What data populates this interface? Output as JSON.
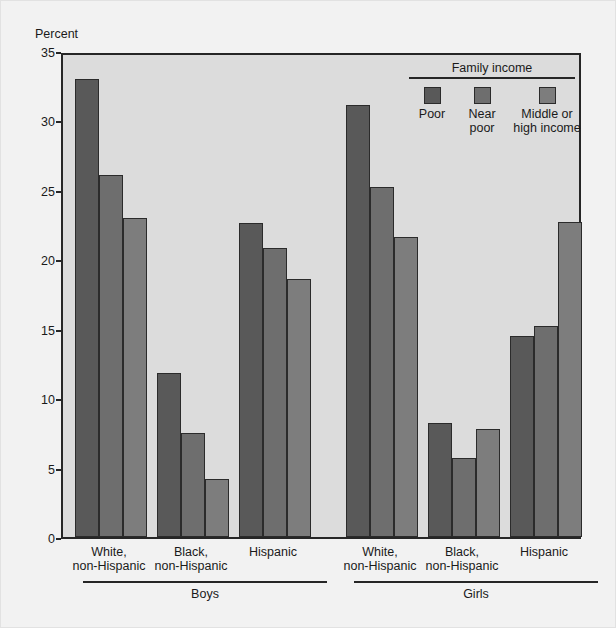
{
  "axis": {
    "ylabel": "Percent",
    "yticks": [
      0,
      5,
      10,
      15,
      20,
      25,
      30,
      35
    ]
  },
  "legend": {
    "title": "Family income",
    "items": [
      {
        "label": "Poor",
        "color": "#595959"
      },
      {
        "label": "Near\npoor",
        "color": "#6e6e6e"
      },
      {
        "label": "Middle or\nhigh income",
        "color": "#7d7d7d"
      }
    ]
  },
  "groups": {
    "boys": "Boys",
    "girls": "Girls"
  },
  "chart_data": {
    "type": "bar",
    "title": "",
    "xlabel": "",
    "ylabel": "Percent",
    "ylim": [
      0,
      35
    ],
    "ytick_step": 5,
    "grid": false,
    "legend_position": "top-right",
    "legend_title": "Family income",
    "categories": [
      "Boys — White, non-Hispanic",
      "Boys — Black, non-Hispanic",
      "Boys — Hispanic",
      "Girls — White, non-Hispanic",
      "Girls — Black, non-Hispanic",
      "Girls — Hispanic"
    ],
    "series": [
      {
        "name": "Poor",
        "color": "#595959",
        "values": [
          33.0,
          11.8,
          22.6,
          31.1,
          8.2,
          14.5
        ]
      },
      {
        "name": "Near poor",
        "color": "#6e6e6e",
        "values": [
          26.1,
          7.5,
          20.8,
          25.2,
          5.7,
          15.2
        ]
      },
      {
        "name": "Middle or high income",
        "color": "#7d7d7d",
        "values": [
          23.0,
          4.2,
          18.6,
          21.6,
          7.8,
          22.7
        ]
      }
    ],
    "group_labels": [
      {
        "sex": "Boys",
        "race": "White,\nnon-Hispanic"
      },
      {
        "sex": "Boys",
        "race": "Black,\nnon-Hispanic"
      },
      {
        "sex": "Boys",
        "race": "Hispanic"
      },
      {
        "sex": "Girls",
        "race": "White,\nnon-Hispanic"
      },
      {
        "sex": "Girls",
        "race": "Black,\nnon-Hispanic"
      },
      {
        "sex": "Girls",
        "race": "Hispanic"
      }
    ]
  }
}
